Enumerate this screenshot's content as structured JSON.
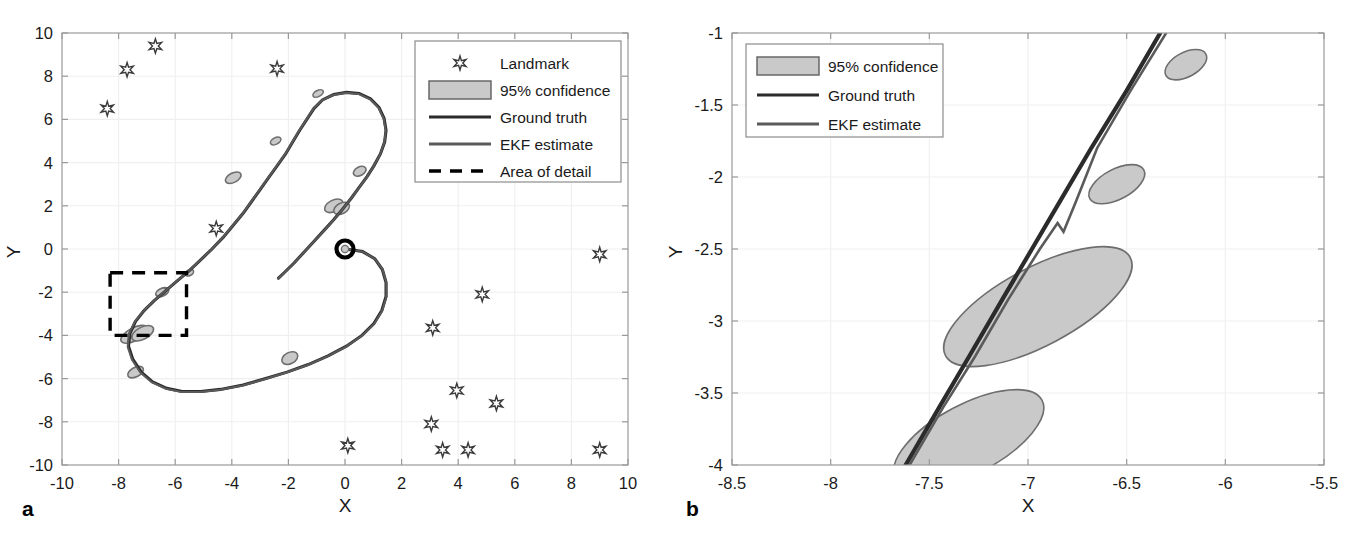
{
  "figure": {
    "panels": [
      {
        "id": "a",
        "letter": "a",
        "xlabel": "X",
        "ylabel": "Y",
        "xticks": [
          "-10",
          "-8",
          "-6",
          "-4",
          "-2",
          "0",
          "2",
          "4",
          "6",
          "8",
          "10"
        ],
        "yticks": [
          "10",
          "8",
          "6",
          "4",
          "2",
          "0",
          "-2",
          "-4",
          "-6",
          "-8",
          "-10"
        ],
        "legend": [
          {
            "label": "Landmark",
            "marker": "star-marker"
          },
          {
            "label": "95% confidence",
            "marker": "patch-swatch"
          },
          {
            "label": "Ground truth",
            "marker": "solid-line-dark"
          },
          {
            "label": "EKF estimate",
            "marker": "solid-line-grey"
          },
          {
            "label": "Area of detail",
            "marker": "dashed-line"
          }
        ]
      },
      {
        "id": "b",
        "letter": "b",
        "xlabel": "X",
        "ylabel": "Y",
        "xticks": [
          "-8.5",
          "-8",
          "-7.5",
          "-7",
          "-6.5",
          "-6",
          "-5.5"
        ],
        "yticks": [
          "-1",
          "-1.5",
          "-2",
          "-2.5",
          "-3",
          "-3.5",
          "-4"
        ],
        "legend": [
          {
            "label": "95% confidence",
            "marker": "patch-swatch"
          },
          {
            "label": "Ground truth",
            "marker": "solid-line-dark"
          },
          {
            "label": "EKF estimate",
            "marker": "solid-line-grey"
          }
        ]
      }
    ]
  },
  "colors": {
    "ground_truth": "#2b2b2b",
    "ekf_estimate": "#5a5a5a",
    "ellipse_fill": "#c9c9c9",
    "ellipse_edge": "#6e6e6e",
    "detail_box": "#000000",
    "grid": "#efefef",
    "axis": "#9a9a9a",
    "text": "#1a1a1a"
  },
  "chart_data": {
    "type": "scatter",
    "title": "",
    "panels": [
      {
        "id": "a",
        "xlabel": "X",
        "ylabel": "Y",
        "xlim": [
          -10,
          10
        ],
        "ylim": [
          -10,
          10
        ],
        "xticks": [
          -10,
          -8,
          -6,
          -4,
          -2,
          0,
          2,
          4,
          6,
          8,
          10
        ],
        "yticks": [
          -10,
          -8,
          -6,
          -4,
          -2,
          0,
          2,
          4,
          6,
          8,
          10
        ],
        "grid": true,
        "legend_position": "top-right",
        "series": [
          {
            "name": "Ground truth",
            "type": "line",
            "points": [
              [
                0.0,
                0.0
              ],
              [
                0.62,
                -0.12
              ],
              [
                1.05,
                -0.45
              ],
              [
                1.32,
                -0.95
              ],
              [
                1.45,
                -1.55
              ],
              [
                1.45,
                -2.2
              ],
              [
                1.3,
                -2.85
              ],
              [
                1.02,
                -3.45
              ],
              [
                0.6,
                -4.0
              ],
              [
                0.05,
                -4.5
              ],
              [
                -0.6,
                -4.95
              ],
              [
                -1.3,
                -5.35
              ],
              [
                -2.05,
                -5.7
              ],
              [
                -2.8,
                -6.0
              ],
              [
                -3.6,
                -6.3
              ],
              [
                -4.4,
                -6.5
              ],
              [
                -5.1,
                -6.6
              ],
              [
                -5.75,
                -6.6
              ],
              [
                -6.3,
                -6.45
              ],
              [
                -6.8,
                -6.15
              ],
              [
                -7.2,
                -5.7
              ],
              [
                -7.5,
                -5.1
              ],
              [
                -7.65,
                -4.5
              ],
              [
                -7.6,
                -3.9
              ],
              [
                -7.4,
                -3.35
              ],
              [
                -7.1,
                -2.85
              ],
              [
                -6.75,
                -2.4
              ],
              [
                -6.35,
                -1.95
              ],
              [
                -5.95,
                -1.5
              ],
              [
                -5.5,
                -1.0
              ],
              [
                -5.1,
                -0.5
              ],
              [
                -4.7,
                0.0
              ],
              [
                -4.3,
                0.55
              ],
              [
                -3.95,
                1.1
              ],
              [
                -3.6,
                1.65
              ],
              [
                -3.3,
                2.2
              ],
              [
                -3.0,
                2.75
              ],
              [
                -2.7,
                3.3
              ],
              [
                -2.4,
                3.85
              ],
              [
                -2.1,
                4.4
              ],
              [
                -1.85,
                4.95
              ],
              [
                -1.6,
                5.5
              ],
              [
                -1.35,
                6.0
              ],
              [
                -1.1,
                6.5
              ],
              [
                -0.8,
                6.9
              ],
              [
                -0.4,
                7.15
              ],
              [
                0.05,
                7.25
              ],
              [
                0.5,
                7.2
              ],
              [
                0.9,
                6.95
              ],
              [
                1.2,
                6.55
              ],
              [
                1.38,
                6.05
              ],
              [
                1.45,
                5.5
              ],
              [
                1.4,
                4.95
              ],
              [
                1.25,
                4.4
              ],
              [
                1.02,
                3.85
              ],
              [
                0.78,
                3.35
              ],
              [
                0.5,
                2.85
              ],
              [
                0.22,
                2.35
              ],
              [
                -0.08,
                1.85
              ],
              [
                -0.4,
                1.35
              ],
              [
                -0.75,
                0.85
              ],
              [
                -1.1,
                0.35
              ],
              [
                -1.45,
                -0.15
              ],
              [
                -1.8,
                -0.65
              ],
              [
                -2.15,
                -1.1
              ],
              [
                -2.35,
                -1.35
              ]
            ]
          },
          {
            "name": "EKF estimate",
            "type": "line",
            "note": "overlaps ground truth, slight divergence",
            "points": [
              [
                0.0,
                0.0
              ],
              [
                0.62,
                -0.12
              ],
              [
                1.06,
                -0.46
              ],
              [
                1.33,
                -0.96
              ],
              [
                1.46,
                -1.56
              ],
              [
                1.46,
                -2.22
              ],
              [
                1.31,
                -2.87
              ],
              [
                1.03,
                -3.47
              ],
              [
                0.6,
                -4.02
              ],
              [
                0.04,
                -4.52
              ],
              [
                -0.62,
                -4.97
              ],
              [
                -1.32,
                -5.37
              ],
              [
                -2.07,
                -5.72
              ],
              [
                -2.82,
                -6.02
              ],
              [
                -3.62,
                -6.32
              ],
              [
                -4.42,
                -6.52
              ],
              [
                -5.12,
                -6.62
              ],
              [
                -5.78,
                -6.62
              ],
              [
                -6.33,
                -6.47
              ],
              [
                -6.83,
                -6.17
              ],
              [
                -7.23,
                -5.72
              ],
              [
                -7.53,
                -5.12
              ],
              [
                -7.68,
                -4.52
              ],
              [
                -7.63,
                -3.92
              ],
              [
                -7.43,
                -3.37
              ],
              [
                -7.12,
                -2.87
              ],
              [
                -6.77,
                -2.42
              ],
              [
                -6.37,
                -1.97
              ],
              [
                -5.97,
                -1.52
              ],
              [
                -5.52,
                -1.02
              ],
              [
                -5.12,
                -0.52
              ],
              [
                -4.72,
                -0.02
              ],
              [
                -4.32,
                0.53
              ],
              [
                -3.97,
                1.08
              ],
              [
                -3.62,
                1.63
              ],
              [
                -3.32,
                2.18
              ],
              [
                -3.02,
                2.73
              ],
              [
                -2.72,
                3.28
              ],
              [
                -2.42,
                3.83
              ],
              [
                -2.12,
                4.38
              ],
              [
                -1.87,
                4.93
              ],
              [
                -1.62,
                5.48
              ],
              [
                -1.37,
                5.98
              ],
              [
                -1.12,
                6.48
              ],
              [
                -0.82,
                6.88
              ],
              [
                -0.42,
                7.13
              ],
              [
                0.04,
                7.23
              ],
              [
                0.49,
                7.18
              ],
              [
                0.89,
                6.93
              ],
              [
                1.19,
                6.53
              ],
              [
                1.37,
                6.03
              ],
              [
                1.44,
                5.48
              ],
              [
                1.39,
                4.93
              ],
              [
                1.24,
                4.38
              ],
              [
                1.01,
                3.83
              ],
              [
                0.77,
                3.33
              ],
              [
                0.49,
                2.83
              ],
              [
                0.21,
                2.33
              ],
              [
                -0.09,
                1.83
              ],
              [
                -0.41,
                1.33
              ],
              [
                -0.76,
                0.83
              ],
              [
                -1.11,
                0.33
              ],
              [
                -1.46,
                -0.17
              ],
              [
                -1.81,
                -0.67
              ],
              [
                -2.16,
                -1.12
              ],
              [
                -2.36,
                -1.37
              ]
            ]
          }
        ],
        "landmarks": {
          "name": "Landmark",
          "marker": "hexagram",
          "points": [
            [
              -6.7,
              9.4
            ],
            [
              -7.7,
              8.3
            ],
            [
              -8.4,
              6.5
            ],
            [
              -2.4,
              8.35
            ],
            [
              -4.55,
              0.95
            ],
            [
              9.0,
              -0.25
            ],
            [
              4.85,
              -2.1
            ],
            [
              3.1,
              -3.65
            ],
            [
              0.1,
              -9.1
            ],
            [
              3.95,
              -6.55
            ],
            [
              5.35,
              -7.15
            ],
            [
              3.05,
              -8.1
            ],
            [
              3.45,
              -9.3
            ],
            [
              4.35,
              -9.3
            ],
            [
              9.0,
              -9.3
            ]
          ]
        },
        "confidence_ellipses": {
          "name": "95% confidence",
          "items": [
            {
              "cx": -7.45,
              "cy": -3.95,
              "rx": 0.52,
              "ry": 0.3,
              "angle": -28
            },
            {
              "cx": -7.15,
              "cy": -3.9,
              "rx": 0.42,
              "ry": 0.28,
              "angle": -28
            },
            {
              "cx": -6.45,
              "cy": -2.0,
              "rx": 0.24,
              "ry": 0.18,
              "angle": -28
            },
            {
              "cx": -7.4,
              "cy": -5.7,
              "rx": 0.3,
              "ry": 0.22,
              "angle": -28
            },
            {
              "cx": -3.95,
              "cy": 3.3,
              "rx": 0.3,
              "ry": 0.22,
              "angle": -28
            },
            {
              "cx": -2.45,
              "cy": 5.0,
              "rx": 0.2,
              "ry": 0.15,
              "angle": -28
            },
            {
              "cx": -0.95,
              "cy": 7.2,
              "rx": 0.2,
              "ry": 0.14,
              "angle": -28
            },
            {
              "cx": 0.52,
              "cy": 3.6,
              "rx": 0.24,
              "ry": 0.2,
              "angle": -28
            },
            {
              "cx": -0.4,
              "cy": 2.0,
              "rx": 0.35,
              "ry": 0.26,
              "angle": -28
            },
            {
              "cx": -0.12,
              "cy": 1.88,
              "rx": 0.3,
              "ry": 0.24,
              "angle": -28
            },
            {
              "cx": -1.95,
              "cy": -5.05,
              "rx": 0.3,
              "ry": 0.26,
              "angle": -28
            },
            {
              "cx": -5.5,
              "cy": -1.1,
              "rx": 0.16,
              "ry": 0.13,
              "angle": -28
            },
            {
              "cx": -6.5,
              "cy": -2.0,
              "rx": 0.2,
              "ry": 0.15,
              "angle": -28
            }
          ]
        },
        "start_marker": {
          "x": 0.0,
          "y": 0.0,
          "style": "black-ring"
        },
        "area_of_detail": {
          "x0": -8.3,
          "y0": -4.0,
          "x1": -5.6,
          "y1": -1.1
        }
      },
      {
        "id": "b",
        "xlabel": "X",
        "ylabel": "Y",
        "xlim": [
          -8.5,
          -5.5
        ],
        "ylim": [
          -4.0,
          -1.0
        ],
        "xticks": [
          -8.5,
          -8,
          -7.5,
          -7,
          -6.5,
          -6,
          -5.5
        ],
        "yticks": [
          -4,
          -3.5,
          -3,
          -2.5,
          -2,
          -1.5,
          -1
        ],
        "grid": true,
        "legend_position": "top-left",
        "series": [
          {
            "name": "Ground truth",
            "type": "line",
            "points": [
              [
                -7.62,
                -4.0
              ],
              [
                -7.45,
                -3.6
              ],
              [
                -7.3,
                -3.25
              ],
              [
                -7.13,
                -2.85
              ],
              [
                -6.98,
                -2.5
              ],
              [
                -6.83,
                -2.15
              ],
              [
                -6.68,
                -1.8
              ],
              [
                -6.5,
                -1.4
              ],
              [
                -6.33,
                -1.0
              ]
            ]
          },
          {
            "name": "EKF estimate",
            "type": "line",
            "points": [
              [
                -7.6,
                -4.0
              ],
              [
                -7.43,
                -3.6
              ],
              [
                -7.27,
                -3.25
              ],
              [
                -7.1,
                -2.85
              ],
              [
                -6.94,
                -2.5
              ],
              [
                -6.85,
                -2.32
              ],
              [
                -6.82,
                -2.38
              ],
              [
                -6.76,
                -2.18
              ],
              [
                -6.65,
                -1.8
              ],
              [
                -6.48,
                -1.4
              ],
              [
                -6.3,
                -1.0
              ]
            ]
          }
        ],
        "confidence_ellipses": {
          "name": "95% confidence",
          "items": [
            {
              "cx": -6.2,
              "cy": -1.22,
              "rx": 0.115,
              "ry": 0.085,
              "angle": -28
            },
            {
              "cx": -6.55,
              "cy": -2.05,
              "rx": 0.155,
              "ry": 0.105,
              "angle": -28
            },
            {
              "cx": -6.95,
              "cy": -2.9,
              "rx": 0.53,
              "ry": 0.27,
              "angle": -28
            },
            {
              "cx": -7.3,
              "cy": -3.82,
              "rx": 0.42,
              "ry": 0.24,
              "angle": -28
            }
          ]
        }
      }
    ]
  }
}
